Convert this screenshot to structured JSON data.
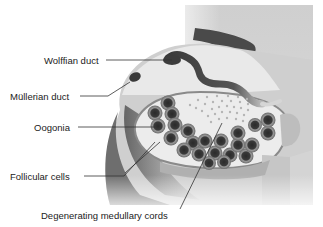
{
  "figure": {
    "labels": [
      {
        "id": "wolffian",
        "text": "Wolffian duct"
      },
      {
        "id": "mullerian",
        "text": "Müllerian duct"
      },
      {
        "id": "oogonia",
        "text": "Oogonia"
      },
      {
        "id": "follicular",
        "text": "Follicular cells"
      },
      {
        "id": "medullary",
        "text": "Degenerating medullary cords"
      }
    ]
  },
  "colors": {
    "background": "#ffffff",
    "tissue_light": "#d9d9d9",
    "tissue_mid": "#a8a8a8",
    "tissue_dark": "#6e6e6e",
    "duct": "#3c3c3c",
    "cortex_fill": "#ececec",
    "cell_outer": "#8a8a8a",
    "cell_inner": "#2e2e2e",
    "leader_line": "#333333",
    "text": "#222222"
  }
}
